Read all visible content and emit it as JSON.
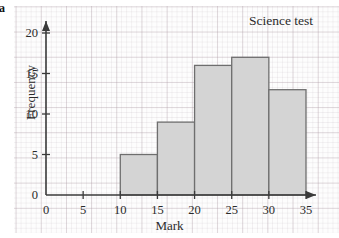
{
  "figure": {
    "panel_label": "a",
    "background": "#fdfdfd",
    "grid_color": "#b6a2ab",
    "axis_color": "#3a3a3a"
  },
  "chart_data": {
    "type": "bar",
    "title": "Science test",
    "xlabel": "Mark",
    "ylabel": "Frequency",
    "xlim": [
      0,
      35
    ],
    "ylim": [
      0,
      21
    ],
    "grid": true,
    "legend": "none",
    "bin_width": 5,
    "bar_color": "#d4d4d4",
    "bar_edge_color": "#6e6e6e",
    "categories": [
      "10-15",
      "15-20",
      "20-25",
      "25-30",
      "30-35"
    ],
    "bin_edges": [
      10,
      15,
      20,
      25,
      30,
      35
    ],
    "values": [
      5,
      9,
      16,
      17,
      13
    ],
    "bars": [
      {
        "from": 10,
        "to": 15,
        "frequency": 5
      },
      {
        "from": 15,
        "to": 20,
        "frequency": 9
      },
      {
        "from": 20,
        "to": 25,
        "frequency": 16
      },
      {
        "from": 25,
        "to": 30,
        "frequency": 17
      },
      {
        "from": 30,
        "to": 35,
        "frequency": 13
      }
    ],
    "xticks": [
      0,
      5,
      10,
      15,
      20,
      25,
      30,
      35
    ],
    "xtick_labels": [
      "0",
      "5",
      "10",
      "15",
      "20",
      "25",
      "30",
      "35"
    ],
    "yticks": [
      0,
      5,
      10,
      15,
      20
    ],
    "ytick_labels": [
      "0",
      "5",
      "10",
      "15",
      "20"
    ]
  },
  "axes": {
    "x_arrow": true,
    "y_arrow": true
  }
}
